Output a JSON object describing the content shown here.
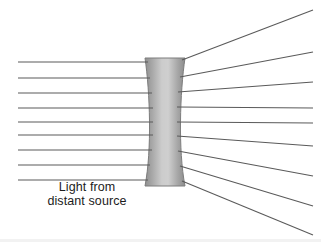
{
  "figure": {
    "background_color": "#ffffff",
    "width": 321,
    "height": 242
  },
  "caption": {
    "line1": "Light from",
    "line2": "distant source",
    "color": "#1c1c1c"
  },
  "lens": {
    "label": "biconcave-diverging-lens",
    "type": "concave",
    "center_x": 165,
    "top_y": 58,
    "bottom_y": 186,
    "outer_half_width": 20,
    "waist_half_width": 13,
    "edge_color": "#8a8a8a",
    "mid_color": "#cfcfcf",
    "outline_color": "#7d7d7d"
  },
  "rays": {
    "color": "#5a5a5a",
    "stroke_width": 1.1,
    "incoming_start_x": 18,
    "incoming_label": "parallel-incoming-ray",
    "outgoing_label": "diverging-outgoing-ray",
    "count": 9,
    "incoming_y": [
      62,
      78,
      93,
      108,
      122,
      135,
      150,
      165,
      180
    ],
    "hit_x": [
      148,
      150,
      152,
      153,
      153,
      153,
      152,
      150,
      148
    ],
    "exit_x": [
      182,
      180,
      178,
      177,
      177,
      177,
      178,
      180,
      182
    ],
    "exit_y": [
      60,
      77,
      92,
      107,
      122,
      136,
      151,
      166,
      181
    ],
    "end_x": [
      313,
      313,
      313,
      313,
      313,
      313,
      313,
      313,
      313
    ],
    "end_y": [
      10,
      52,
      82,
      108,
      123,
      146,
      176,
      206,
      235
    ]
  },
  "chart_data": {
    "type": "line",
    "xlabel": "",
    "ylabel": "",
    "series": [
      {
        "name": "incoming-ray-1",
        "x": [
          18,
          148
        ],
        "y": [
          62,
          62
        ]
      },
      {
        "name": "incoming-ray-2",
        "x": [
          18,
          150
        ],
        "y": [
          78,
          78
        ]
      },
      {
        "name": "incoming-ray-3",
        "x": [
          18,
          152
        ],
        "y": [
          93,
          93
        ]
      },
      {
        "name": "incoming-ray-4",
        "x": [
          18,
          153
        ],
        "y": [
          108,
          108
        ]
      },
      {
        "name": "incoming-ray-5",
        "x": [
          18,
          153
        ],
        "y": [
          122,
          122
        ]
      },
      {
        "name": "incoming-ray-6",
        "x": [
          18,
          153
        ],
        "y": [
          135,
          135
        ]
      },
      {
        "name": "incoming-ray-7",
        "x": [
          18,
          152
        ],
        "y": [
          150,
          150
        ]
      },
      {
        "name": "incoming-ray-8",
        "x": [
          18,
          150
        ],
        "y": [
          165,
          165
        ]
      },
      {
        "name": "incoming-ray-9",
        "x": [
          18,
          148
        ],
        "y": [
          180,
          180
        ]
      },
      {
        "name": "outgoing-ray-1",
        "x": [
          182,
          313
        ],
        "y": [
          60,
          10
        ]
      },
      {
        "name": "outgoing-ray-2",
        "x": [
          180,
          313
        ],
        "y": [
          77,
          52
        ]
      },
      {
        "name": "outgoing-ray-3",
        "x": [
          178,
          313
        ],
        "y": [
          92,
          82
        ]
      },
      {
        "name": "outgoing-ray-4",
        "x": [
          177,
          313
        ],
        "y": [
          107,
          108
        ]
      },
      {
        "name": "outgoing-ray-5",
        "x": [
          177,
          313
        ],
        "y": [
          122,
          123
        ]
      },
      {
        "name": "outgoing-ray-6",
        "x": [
          177,
          313
        ],
        "y": [
          136,
          146
        ]
      },
      {
        "name": "outgoing-ray-7",
        "x": [
          178,
          313
        ],
        "y": [
          151,
          176
        ]
      },
      {
        "name": "outgoing-ray-8",
        "x": [
          180,
          313
        ],
        "y": [
          166,
          206
        ]
      },
      {
        "name": "outgoing-ray-9",
        "x": [
          182,
          313
        ],
        "y": [
          181,
          235
        ]
      }
    ],
    "annotations": [
      "Light from distant source"
    ],
    "grid": false,
    "legend": "none"
  }
}
